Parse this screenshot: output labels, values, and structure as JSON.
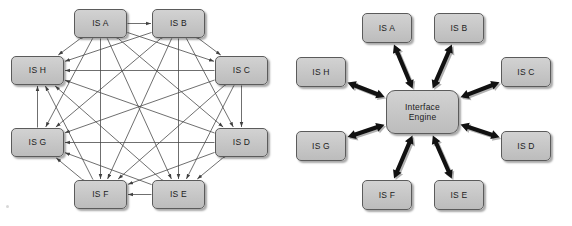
{
  "figure": {
    "background_color": "#ffffff",
    "node_fill_color": "#c6c6c6",
    "node_border_color": "#5b5b5b",
    "mesh_line_color": "#4a4a4a",
    "hub_arrow_color": "#111111"
  },
  "panels": [
    {
      "id": "point-to-point-mesh",
      "type": "mesh",
      "nodes": [
        {
          "id": "A",
          "label": "IS A",
          "x": 74,
          "y": 9,
          "w": 53,
          "h": 29
        },
        {
          "id": "B",
          "label": "IS B",
          "x": 152,
          "y": 9,
          "w": 53,
          "h": 29
        },
        {
          "id": "C",
          "label": "IS C",
          "x": 215,
          "y": 56,
          "w": 53,
          "h": 29
        },
        {
          "id": "D",
          "label": "IS D",
          "x": 215,
          "y": 128,
          "w": 53,
          "h": 29
        },
        {
          "id": "E",
          "label": "IS E",
          "x": 152,
          "y": 180,
          "w": 53,
          "h": 29
        },
        {
          "id": "F",
          "label": "IS F",
          "x": 74,
          "y": 180,
          "w": 53,
          "h": 29
        },
        {
          "id": "G",
          "label": "IS G",
          "x": 11,
          "y": 128,
          "w": 53,
          "h": 29
        },
        {
          "id": "H",
          "label": "IS H",
          "x": 11,
          "y": 56,
          "w": 53,
          "h": 29
        }
      ],
      "connections": [
        [
          "A",
          "B"
        ],
        [
          "A",
          "C"
        ],
        [
          "A",
          "D"
        ],
        [
          "A",
          "E"
        ],
        [
          "A",
          "F"
        ],
        [
          "A",
          "G"
        ],
        [
          "A",
          "H"
        ],
        [
          "B",
          "C"
        ],
        [
          "B",
          "D"
        ],
        [
          "B",
          "E"
        ],
        [
          "B",
          "F"
        ],
        [
          "B",
          "G"
        ],
        [
          "B",
          "H"
        ],
        [
          "C",
          "D"
        ],
        [
          "C",
          "E"
        ],
        [
          "C",
          "F"
        ],
        [
          "C",
          "G"
        ],
        [
          "C",
          "H"
        ],
        [
          "D",
          "E"
        ],
        [
          "D",
          "F"
        ],
        [
          "D",
          "G"
        ],
        [
          "D",
          "H"
        ],
        [
          "E",
          "F"
        ],
        [
          "E",
          "G"
        ],
        [
          "E",
          "H"
        ],
        [
          "F",
          "G"
        ],
        [
          "F",
          "H"
        ],
        [
          "G",
          "H"
        ]
      ],
      "connection_count": 28,
      "arrow_style": "double-headed-thin"
    },
    {
      "id": "interface-engine-hub",
      "type": "hub-and-spoke",
      "hub": {
        "id": "HUB",
        "label": "Interface\nEngine",
        "x": 100,
        "y": 90,
        "w": 73,
        "h": 44
      },
      "nodes": [
        {
          "id": "A",
          "label": "IS A",
          "x": 76,
          "y": 13,
          "w": 50,
          "h": 30
        },
        {
          "id": "B",
          "label": "IS B",
          "x": 148,
          "y": 13,
          "w": 50,
          "h": 30
        },
        {
          "id": "C",
          "label": "IS C",
          "x": 215,
          "y": 57,
          "w": 50,
          "h": 30
        },
        {
          "id": "D",
          "label": "IS D",
          "x": 215,
          "y": 131,
          "w": 50,
          "h": 30
        },
        {
          "id": "E",
          "label": "IS E",
          "x": 148,
          "y": 180,
          "w": 50,
          "h": 30
        },
        {
          "id": "F",
          "label": "IS F",
          "x": 76,
          "y": 180,
          "w": 50,
          "h": 30
        },
        {
          "id": "G",
          "label": "IS G",
          "x": 10,
          "y": 131,
          "w": 50,
          "h": 30
        },
        {
          "id": "H",
          "label": "IS H",
          "x": 10,
          "y": 57,
          "w": 50,
          "h": 30
        }
      ],
      "connections": [
        [
          "HUB",
          "A"
        ],
        [
          "HUB",
          "B"
        ],
        [
          "HUB",
          "C"
        ],
        [
          "HUB",
          "D"
        ],
        [
          "HUB",
          "E"
        ],
        [
          "HUB",
          "F"
        ],
        [
          "HUB",
          "G"
        ],
        [
          "HUB",
          "H"
        ]
      ],
      "connection_count": 8,
      "arrow_style": "double-headed-thick"
    }
  ]
}
